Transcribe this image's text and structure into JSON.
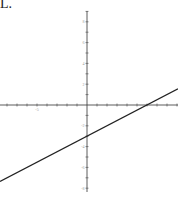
{
  "option_label": "L.",
  "chart_data": {
    "type": "line",
    "title": "",
    "xlabel": "",
    "ylabel": "",
    "xlim": [
      -8.7,
      9.1
    ],
    "ylim": [
      -8.3,
      9.1
    ],
    "grid": false,
    "x_tick_step": 1,
    "y_tick_step": 1,
    "x_tick_labels": [
      {
        "value": -5,
        "text": "-5"
      }
    ],
    "y_tick_labels": [
      {
        "value": 8,
        "text": "8"
      },
      {
        "value": 6,
        "text": "6"
      },
      {
        "value": 4,
        "text": "4"
      },
      {
        "value": 2,
        "text": "2"
      },
      {
        "value": -2,
        "text": "-2"
      },
      {
        "value": -4,
        "text": "-4"
      },
      {
        "value": -6,
        "text": "-6"
      },
      {
        "value": -8,
        "text": "-8"
      }
    ],
    "series": [
      {
        "name": "y = 0.5x - 3",
        "slope": 0.5,
        "intercept": -3,
        "x": [
          -8.7,
          9.1
        ],
        "y": [
          -7.35,
          1.55
        ],
        "color": "#222222"
      }
    ],
    "x_intercept": 6,
    "y_intercept": -3
  }
}
